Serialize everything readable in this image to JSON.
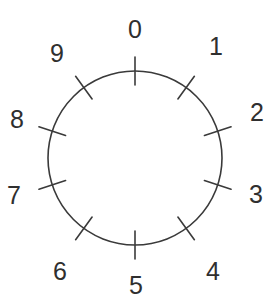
{
  "figure": {
    "name": "numbered-dial",
    "background_color": "#ffffff",
    "stroke_color": "#3a3a3a",
    "text_color": "#2f2f2f",
    "stroke_width": 1.6
  },
  "dial": {
    "center_x": 135,
    "center_y": 158,
    "radius": 87,
    "tick_count": 10,
    "tick_step_degrees": 36,
    "tick_start_degrees": 0,
    "tick_inner_offset": 14,
    "tick_outer_offset": 14,
    "label_radius": 116
  },
  "chart_data": {
    "type": "scatter",
    "title": "",
    "xlabel": "",
    "ylabel": "",
    "categories": [
      "0",
      "1",
      "2",
      "3",
      "4",
      "5",
      "6",
      "7",
      "8",
      "9"
    ],
    "values": [
      0,
      36,
      72,
      108,
      144,
      180,
      216,
      252,
      288,
      324
    ],
    "ylim": [
      0,
      360
    ],
    "grid": false,
    "legend": "none"
  },
  "labels": [
    {
      "text": "0",
      "angle_degrees": 0,
      "x": 135,
      "y": 30
    },
    {
      "text": "1",
      "angle_degrees": 36,
      "x": 216,
      "y": 47
    },
    {
      "text": "2",
      "angle_degrees": 72,
      "x": 257,
      "y": 113
    },
    {
      "text": "3",
      "angle_degrees": 108,
      "x": 256,
      "y": 195
    },
    {
      "text": "4",
      "angle_degrees": 144,
      "x": 213,
      "y": 272
    },
    {
      "text": "5",
      "angle_degrees": 180,
      "x": 136,
      "y": 286
    },
    {
      "text": "6",
      "angle_degrees": 216,
      "x": 60,
      "y": 272
    },
    {
      "text": "7",
      "angle_degrees": 252,
      "x": 14,
      "y": 196
    },
    {
      "text": "8",
      "angle_degrees": 288,
      "x": 17,
      "y": 120
    },
    {
      "text": "9",
      "angle_degrees": 324,
      "x": 57,
      "y": 54
    }
  ]
}
